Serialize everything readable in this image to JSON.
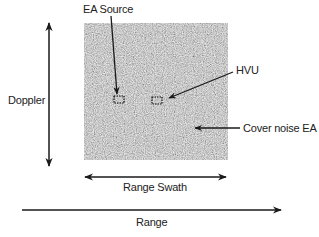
{
  "diagram": {
    "labels": {
      "ea_source": "EA Source",
      "hvu": "HVU",
      "doppler": "Doppler",
      "cover_noise": "Cover noise EA",
      "range_swath": "Range Swath",
      "range": "Range"
    },
    "noise_box": {
      "x": 84,
      "y": 23,
      "width": 144,
      "height": 137,
      "base_color": "#a6a6a6"
    },
    "targets": [
      {
        "name": "EA Source",
        "x": 114,
        "y": 96,
        "width": 10,
        "height": 7
      },
      {
        "name": "HVU",
        "x": 152,
        "y": 97,
        "width": 10,
        "height": 7
      }
    ],
    "colors": {
      "line": "#1a1a1a",
      "text": "#222222",
      "background": "#ffffff"
    }
  }
}
